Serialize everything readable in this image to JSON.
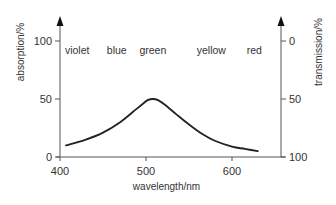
{
  "chart_data": {
    "type": "line",
    "title": "",
    "xlabel": "wavelength/nm",
    "ylabel": "absorption/%",
    "y2label": "transmission/%",
    "xlim": [
      400,
      650
    ],
    "ylim": [
      0,
      100
    ],
    "y2lim": [
      100,
      0
    ],
    "xticks": [
      400,
      500,
      600
    ],
    "yticks": [
      0,
      50,
      100
    ],
    "y2ticks": [
      100,
      50,
      0
    ],
    "grid": false,
    "legend": "none",
    "color_bands": [
      {
        "label": "violet",
        "x": 420
      },
      {
        "label": "blue",
        "x": 466
      },
      {
        "label": "green",
        "x": 508
      },
      {
        "label": "yellow",
        "x": 576
      },
      {
        "label": "red",
        "x": 626
      }
    ],
    "series": [
      {
        "name": "absorption",
        "color": "#222222",
        "x": [
          407,
          430,
          450,
          470,
          485,
          495,
          502,
          508,
          514,
          522,
          535,
          550,
          565,
          580,
          600,
          615,
          630
        ],
        "y": [
          10,
          15,
          21,
          30,
          39,
          45,
          49,
          50,
          49,
          45,
          37,
          28,
          20,
          14,
          9,
          7,
          5
        ]
      }
    ]
  }
}
